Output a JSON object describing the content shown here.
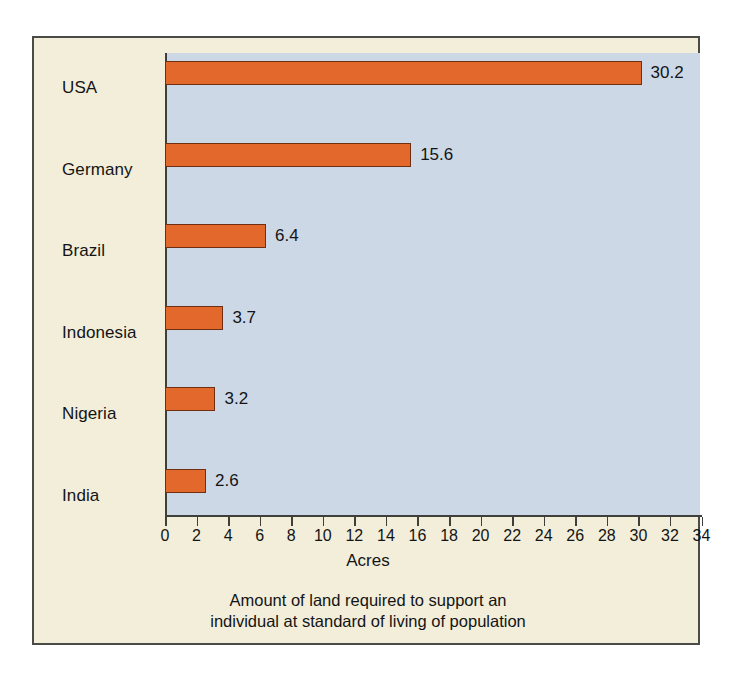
{
  "chart_data": {
    "type": "bar",
    "orientation": "horizontal",
    "title": "",
    "caption_line1": "Amount of land required to support an",
    "caption_line2": "individual at standard of living of population",
    "xlabel": "Acres",
    "ylabel": "",
    "xlim": [
      0,
      34
    ],
    "grid": false,
    "legend": "none",
    "categories": [
      "USA",
      "Germany",
      "Brazil",
      "Indonesia",
      "Nigeria",
      "India"
    ],
    "values": [
      30.2,
      15.6,
      6.4,
      3.7,
      3.2,
      2.6
    ],
    "value_labels": [
      "30.2",
      "15.6",
      "6.4",
      "3.7",
      "3.2",
      "2.6"
    ],
    "xticks": [
      0,
      2,
      4,
      6,
      8,
      10,
      12,
      14,
      16,
      18,
      20,
      22,
      24,
      26,
      28,
      30,
      32,
      34
    ],
    "xtick_labels": [
      "0",
      "2",
      "4",
      "6",
      "8",
      "10",
      "12",
      "14",
      "16",
      "18",
      "20",
      "22",
      "24",
      "26",
      "28",
      "30",
      "32",
      "34"
    ],
    "colors": {
      "bar_fill": "#e2682c",
      "bar_stroke": "#6e2f12",
      "plot_background": "#ccd8e6",
      "figure_background": "#f2eeda",
      "axis": "#3f3f3c",
      "text": "#141414"
    }
  }
}
